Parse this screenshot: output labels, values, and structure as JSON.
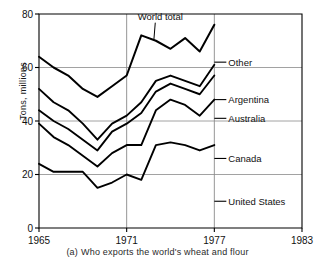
{
  "figure": {
    "caption_index": "(a)",
    "caption_text": "Who exports the world's wheat and flour"
  },
  "axes": {
    "ylabel": "Tons, millions",
    "yticks": [
      "0",
      "20",
      "40",
      "60",
      "80"
    ],
    "xticks": [
      "1965",
      "1971",
      "1977",
      "1983"
    ]
  },
  "labels": {
    "world_total": "World total",
    "other": "Other",
    "argentina": "Argentina",
    "australia": "Australia",
    "canada": "Canada",
    "united_states": "United States"
  },
  "colors": {
    "line": "#000000",
    "grid": "#8a8a8a",
    "frame": "#000000",
    "text": "#111111",
    "background": "#ffffff"
  },
  "chart_data": {
    "type": "line",
    "title": "Who exports the world's wheat and flour",
    "subtitle": "",
    "xlabel": "",
    "ylabel": "Tons, millions",
    "xlim": [
      1965,
      1983
    ],
    "ylim": [
      0,
      80
    ],
    "xticks": [
      1965,
      1971,
      1977,
      1983
    ],
    "yticks": [
      0,
      20,
      40,
      60,
      80
    ],
    "grid": true,
    "legend_position": "right-inline-labels",
    "stacked": true,
    "note": "Cumulative/stacked bands; top curve is the world total. Data plotted 1965-1977 only; axis extends to 1983.",
    "x": [
      1965,
      1966,
      1967,
      1968,
      1969,
      1970,
      1971,
      1972,
      1973,
      1974,
      1975,
      1976,
      1977
    ],
    "annotations": [
      {
        "text": "World total",
        "x": 1973.3,
        "y": 79,
        "points_to": {
          "x": 1973,
          "y": 70
        }
      }
    ],
    "series": [
      {
        "name": "United States",
        "label_y": 10,
        "values": [
          24,
          21,
          21,
          21,
          15,
          17,
          20,
          18,
          31,
          32,
          31,
          29,
          31
        ]
      },
      {
        "name": "Canada",
        "label_y": 26,
        "cumulative": [
          39,
          34,
          31,
          27,
          23,
          28,
          31,
          31,
          44,
          48,
          46,
          42,
          48
        ],
        "values": [
          15,
          13,
          10,
          6,
          8,
          11,
          11,
          13,
          13,
          16,
          15,
          13,
          17
        ]
      },
      {
        "name": "Australia",
        "label_y": 41,
        "cumulative": [
          44,
          40,
          37,
          33,
          29,
          36,
          39,
          43,
          51,
          54,
          52,
          50,
          57
        ],
        "values": [
          5,
          6,
          6,
          6,
          6,
          8,
          8,
          12,
          7,
          6,
          6,
          8,
          9
        ]
      },
      {
        "name": "Argentina",
        "label_y": 48,
        "cumulative": [
          52,
          47,
          44,
          39,
          33,
          39,
          42,
          47,
          55,
          57,
          55,
          53,
          61
        ],
        "values": [
          8,
          7,
          7,
          6,
          4,
          3,
          3,
          4,
          4,
          3,
          3,
          3,
          4
        ]
      },
      {
        "name": "Other",
        "label_y": 62,
        "cumulative": [
          64,
          60,
          57,
          52,
          49,
          53,
          57,
          72,
          70,
          67,
          71,
          66,
          76
        ],
        "values": [
          12,
          13,
          13,
          13,
          16,
          14,
          15,
          25,
          15,
          10,
          16,
          13,
          15
        ]
      }
    ]
  }
}
